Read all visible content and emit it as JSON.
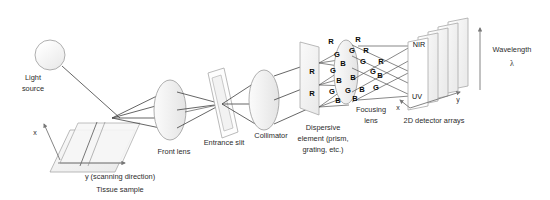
{
  "figure": {
    "background": "#ffffff",
    "ink": "#2b2b2b"
  },
  "components": {
    "light_source": {
      "label_line1": "Light",
      "label_line2": "source",
      "icon": "lamp-circle-icon"
    },
    "tissue_sample": {
      "label": "Tissue sample",
      "icon": "sample-plane-icon"
    },
    "scan_axis": {
      "label": "y (scanning direction)",
      "icon": "arrow-right-icon"
    },
    "cross_axis": {
      "label": "x",
      "icon": "arrow-up-icon"
    },
    "front_lens": {
      "label": "Front lens",
      "icon": "lens-ellipse-icon"
    },
    "entrance_slit": {
      "label": "Entrance slit",
      "icon": "slit-frame-icon"
    },
    "collimator": {
      "label": "Collimator",
      "icon": "lens-ellipse-icon"
    },
    "dispersive_element": {
      "label_line1": "Dispersive",
      "label_line2": "element (prism,",
      "label_line3": "grating, etc.)",
      "icon": "prism-plane-icon"
    },
    "focusing_lens": {
      "label_line1": "Focusing",
      "label_line2": "lens",
      "icon": "lens-ellipse-icon"
    },
    "detector_arrays": {
      "label": "2D detector arrays",
      "icon": "detector-stack-icon"
    },
    "detector_axis_x": {
      "label": "x",
      "icon": "arrow-down-icon"
    },
    "detector_axis_y": {
      "label": "y",
      "icon": "arrow-right-icon"
    },
    "wavelength_axis": {
      "label": "Wavelength",
      "symbol": "λ",
      "icon": "arrow-up-icon"
    }
  },
  "spectral_bands": {
    "top_band": "NIR",
    "bottom_band": "UV",
    "letters": {
      "red": "R",
      "green": "G",
      "blue": "B"
    }
  },
  "dispersion_labels": {
    "pre_lens": [
      {
        "t": "R",
        "x": 331,
        "y": 42
      },
      {
        "t": "G",
        "x": 337,
        "y": 55
      },
      {
        "t": "B",
        "x": 343,
        "y": 64
      },
      {
        "t": "R",
        "x": 312,
        "y": 72
      },
      {
        "t": "G",
        "x": 333,
        "y": 71
      },
      {
        "t": "B",
        "x": 339,
        "y": 81
      },
      {
        "t": "R",
        "x": 312,
        "y": 94
      },
      {
        "t": "G",
        "x": 332,
        "y": 92
      },
      {
        "t": "B",
        "x": 338,
        "y": 101
      }
    ],
    "post_lens": [
      {
        "t": "R",
        "x": 358,
        "y": 40
      },
      {
        "t": "G",
        "x": 352,
        "y": 51
      },
      {
        "t": "R",
        "x": 366,
        "y": 51
      },
      {
        "t": "G",
        "x": 363,
        "y": 62
      },
      {
        "t": "R",
        "x": 381,
        "y": 62
      },
      {
        "t": "G",
        "x": 373,
        "y": 72
      },
      {
        "t": "B",
        "x": 353,
        "y": 78
      },
      {
        "t": "B",
        "x": 380,
        "y": 76
      },
      {
        "t": "G",
        "x": 348,
        "y": 91
      },
      {
        "t": "B",
        "x": 362,
        "y": 90
      },
      {
        "t": "B",
        "x": 355,
        "y": 99
      },
      {
        "t": "G",
        "x": 376,
        "y": 88
      }
    ]
  }
}
